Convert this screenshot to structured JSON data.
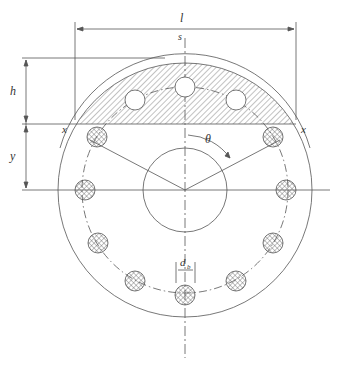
{
  "diagram": {
    "labels": {
      "length": "l",
      "s": "s",
      "h": "h",
      "y": "y",
      "x_left": "x",
      "x_right": "x",
      "theta": "θ",
      "d": "d",
      "d_sub": "b"
    },
    "colors": {
      "line": "#555555",
      "hatch": "#666666",
      "bg": "#ffffff"
    }
  }
}
